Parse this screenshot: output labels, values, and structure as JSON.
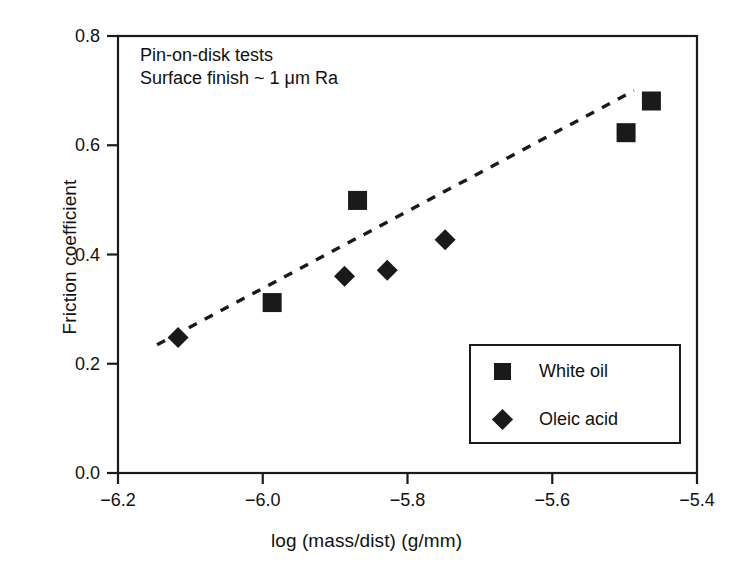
{
  "chart_data": {
    "type": "scatter",
    "title": "",
    "xlabel": "log (mass/dist) (g/mm)",
    "ylabel": "Friction coefficient",
    "xlim": [
      -6.2,
      -5.4
    ],
    "ylim": [
      0.0,
      0.8
    ],
    "xticks": [
      -6.2,
      -6.0,
      -5.8,
      -5.6,
      -5.4
    ],
    "xticklabels": [
      "−6.2",
      "−6.0",
      "−5.8",
      "−5.6",
      "−5.4"
    ],
    "yticks": [
      0.0,
      0.2,
      0.4,
      0.6,
      0.8
    ],
    "yticklabels": [
      "0.0",
      "0.2",
      "0.4",
      "0.6",
      "0.8"
    ],
    "grid": false,
    "legend_position": "lower-right",
    "annotations": [
      "Pin-on-disk tests",
      "Surface finish ~ 1 μm Ra"
    ],
    "marker_color": "#1a1a1a",
    "series": [
      {
        "name": "White oil",
        "marker": "square",
        "points": [
          {
            "x": -5.987,
            "y": 0.312
          },
          {
            "x": -5.869,
            "y": 0.499
          },
          {
            "x": -5.498,
            "y": 0.623
          },
          {
            "x": -5.463,
            "y": 0.681
          }
        ]
      },
      {
        "name": "Oleic acid",
        "marker": "diamond",
        "points": [
          {
            "x": -6.117,
            "y": 0.248
          },
          {
            "x": -5.887,
            "y": 0.36
          },
          {
            "x": -5.828,
            "y": 0.371
          },
          {
            "x": -5.748,
            "y": 0.427
          }
        ]
      }
    ],
    "trendline": {
      "style": "dashed",
      "x0": -6.146,
      "y0": 0.235,
      "x1": -5.487,
      "y1": 0.7
    }
  },
  "legend": {
    "entries": [
      {
        "label": "White oil",
        "marker": "square"
      },
      {
        "label": "Oleic acid",
        "marker": "diamond"
      }
    ]
  }
}
